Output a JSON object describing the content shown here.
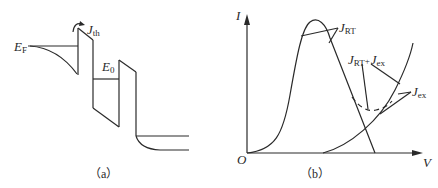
{
  "panel_a": {
    "caption": "（a）",
    "labels": {
      "fermi_level": {
        "main": "E",
        "sub": "F"
      },
      "thermionic_current": {
        "main": "J",
        "sub": "th"
      },
      "resonant_level": {
        "main": "E",
        "sub": "0"
      }
    }
  },
  "panel_b": {
    "caption": "（b）",
    "axes": {
      "y_label": "I",
      "x_label": "V",
      "origin_label": "O"
    },
    "labels": {
      "resonant_current": {
        "main": "J",
        "sub": "RT"
      },
      "total_current": {
        "main": "J",
        "sub1": "RT",
        "plus": "+",
        "main2": "J",
        "sub2": "ex"
      },
      "excess_current": {
        "main": "J",
        "sub": "ex"
      }
    }
  }
}
